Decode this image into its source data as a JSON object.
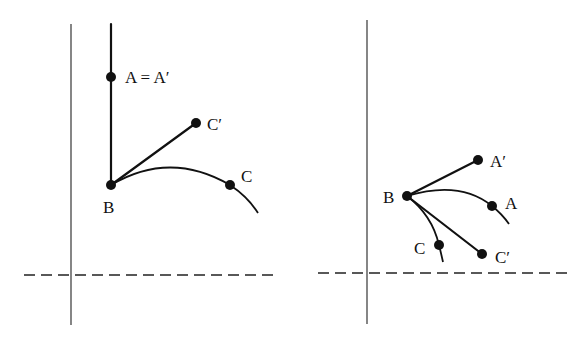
{
  "colors": {
    "ink": "#111111",
    "axis": "#222222",
    "background": "#ffffff"
  },
  "panels": [
    {
      "id": "left",
      "axis_vertical": {
        "x": 71,
        "y1": 24,
        "y2": 325
      },
      "dashed_baseline": {
        "y": 275,
        "x1": 24,
        "x2": 274
      },
      "points": [
        {
          "name": "A",
          "label": "A = A′",
          "x": 111,
          "y": 77,
          "label_x": 125,
          "label_y": 83
        },
        {
          "name": "B",
          "label": "B",
          "x": 111,
          "y": 185,
          "label_x": 103,
          "label_y": 213
        },
        {
          "name": "C_prime",
          "label": "C′",
          "x": 196,
          "y": 123,
          "label_x": 207,
          "label_y": 130
        },
        {
          "name": "C",
          "label": "C",
          "x": 230,
          "y": 185,
          "label_x": 241,
          "label_y": 182
        }
      ],
      "segments": [
        {
          "name": "vertical-ray-through-A",
          "x1": 111,
          "y1": 24,
          "x2": 111,
          "y2": 185
        },
        {
          "name": "segment-B-Cprime",
          "x1": 111,
          "y1": 185,
          "x2": 196,
          "y2": 123
        }
      ],
      "curves": [
        {
          "name": "curve-B-C",
          "d": "M111,185 Q170,150 230,185 Q248,197 258,213"
        }
      ]
    },
    {
      "id": "right",
      "axis_vertical": {
        "x": 367,
        "y1": 20,
        "y2": 324
      },
      "dashed_baseline": {
        "y": 273,
        "x1": 318,
        "x2": 568
      },
      "points": [
        {
          "name": "B",
          "label": "B",
          "x": 407,
          "y": 196,
          "label_x": 383,
          "label_y": 203
        },
        {
          "name": "A_prime",
          "label": "A′",
          "x": 478,
          "y": 160,
          "label_x": 490,
          "label_y": 167
        },
        {
          "name": "A",
          "label": "A",
          "x": 492,
          "y": 206,
          "label_x": 505,
          "label_y": 209
        },
        {
          "name": "C",
          "label": "C",
          "x": 439,
          "y": 245,
          "label_x": 414,
          "label_y": 254
        },
        {
          "name": "C_prime",
          "label": "C′",
          "x": 482,
          "y": 254,
          "label_x": 495,
          "label_y": 263
        }
      ],
      "segments": [
        {
          "name": "segment-B-Aprime",
          "x1": 407,
          "y1": 196,
          "x2": 478,
          "y2": 160
        },
        {
          "name": "segment-B-Cprime",
          "x1": 407,
          "y1": 196,
          "x2": 482,
          "y2": 254
        }
      ],
      "curves": [
        {
          "name": "curve-B-A",
          "d": "M407,196 Q460,180 492,206 Q502,214 509,224"
        },
        {
          "name": "curve-B-C",
          "d": "M407,196 Q432,215 439,245 Q441,253 443,262"
        }
      ]
    }
  ],
  "point_radius": 5
}
